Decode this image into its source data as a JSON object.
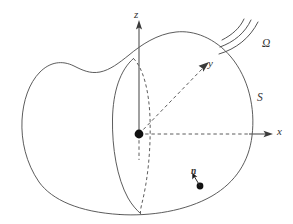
{
  "figure": {
    "background_color": "#ffffff",
    "line_color": "#4a4a4a",
    "width": 293,
    "height": 224
  },
  "labels": {
    "z_axis": "z",
    "y_axis": "y",
    "x_axis": "x",
    "region": "Ω",
    "surface": "S",
    "normal": "n"
  },
  "annotations": {
    "origin_marker": "origin-dot",
    "normal_marker": "surface-point-dot",
    "radiation_arcs": 3
  },
  "geometry": {
    "origin": {
      "x": 139,
      "y": 134
    },
    "x_axis_tip": {
      "x": 272,
      "y": 134
    },
    "z_axis_tip": {
      "x": 139,
      "y": 21
    },
    "y_axis_tip": {
      "x": 209,
      "y": 63
    },
    "normal_point": {
      "x": 200,
      "y": 186
    }
  }
}
